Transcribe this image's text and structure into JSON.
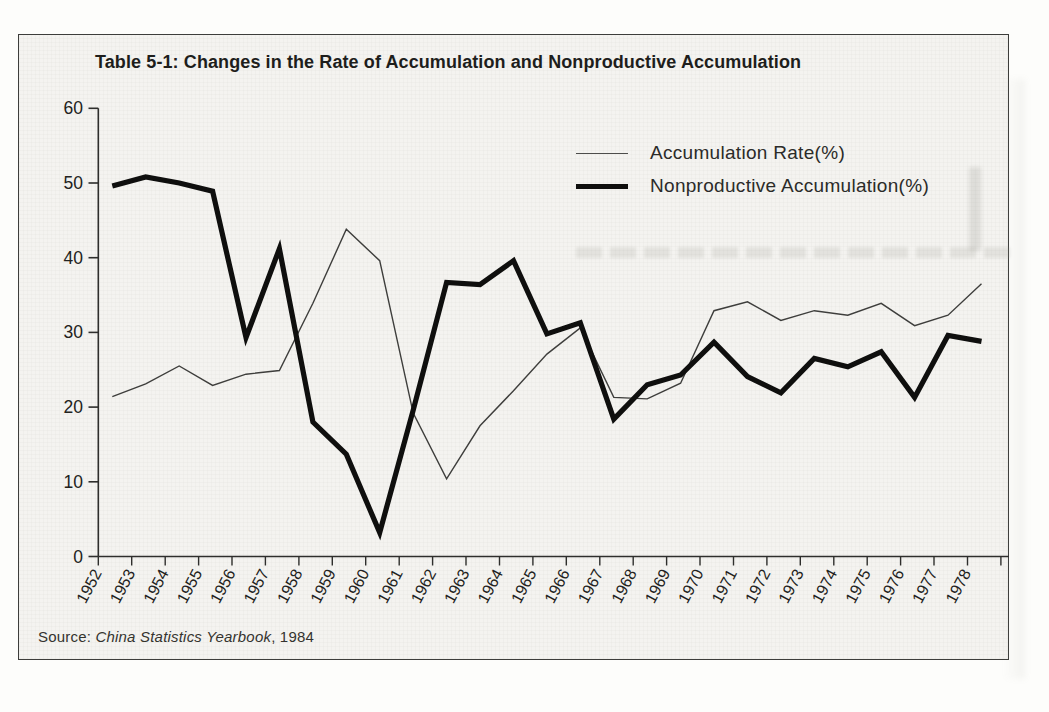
{
  "page": {
    "source": {
      "prefix": "Source: ",
      "work": "China Statistics Yearbook",
      "suffix": ", 1984"
    }
  },
  "chart_data": {
    "type": "line",
    "title": "Table 5-1: Changes in the Rate of Accumulation and Nonproductive Accumulation",
    "x": [
      1952,
      1953,
      1954,
      1955,
      1956,
      1957,
      1958,
      1959,
      1960,
      1961,
      1962,
      1963,
      1964,
      1965,
      1966,
      1967,
      1968,
      1969,
      1970,
      1971,
      1972,
      1973,
      1974,
      1975,
      1976,
      1977,
      1978
    ],
    "series": [
      {
        "name": "Accumulation Rate(%)",
        "style": "thin",
        "color": "#3e3e3c",
        "stroke_width": 1.4,
        "values": [
          21.4,
          23.1,
          25.5,
          22.9,
          24.4,
          24.9,
          33.9,
          43.8,
          39.6,
          19.2,
          10.4,
          17.5,
          22.2,
          27.1,
          30.6,
          21.3,
          21.1,
          23.2,
          32.9,
          34.1,
          31.6,
          32.9,
          32.3,
          33.9,
          30.9,
          32.3,
          36.5
        ]
      },
      {
        "name": "Nonproductive Accumulation(%)",
        "style": "thick",
        "color": "#0f0f0e",
        "stroke_width": 5.2,
        "values": [
          49.6,
          50.8,
          50.0,
          48.9,
          29.3,
          41.2,
          18.0,
          13.7,
          3.2,
          19.6,
          36.7,
          36.4,
          39.6,
          29.8,
          31.3,
          18.4,
          23.0,
          24.3,
          28.7,
          24.1,
          21.9,
          26.5,
          25.4,
          27.4,
          21.3,
          29.6,
          28.8
        ]
      }
    ],
    "ylim": [
      0,
      60
    ],
    "yticks": [
      0,
      10,
      20,
      30,
      40,
      50,
      60
    ],
    "grid": false,
    "legend_position": "top-right",
    "source_note": "Source: China Statistics Yearbook, 1984"
  }
}
